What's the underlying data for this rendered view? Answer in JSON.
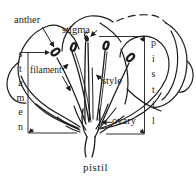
{
  "figure": {
    "type": "flower-anatomy-diagram",
    "background": "#ffffff",
    "ink_color": "#1c1c1c",
    "labels": {
      "anther": "anther",
      "stigma": "stigma",
      "filament": "filament",
      "style": "style",
      "ovary": "ovary",
      "stamen_bracket": "stamen",
      "pistil_bracket": "pistil",
      "caption": "pistil"
    }
  }
}
